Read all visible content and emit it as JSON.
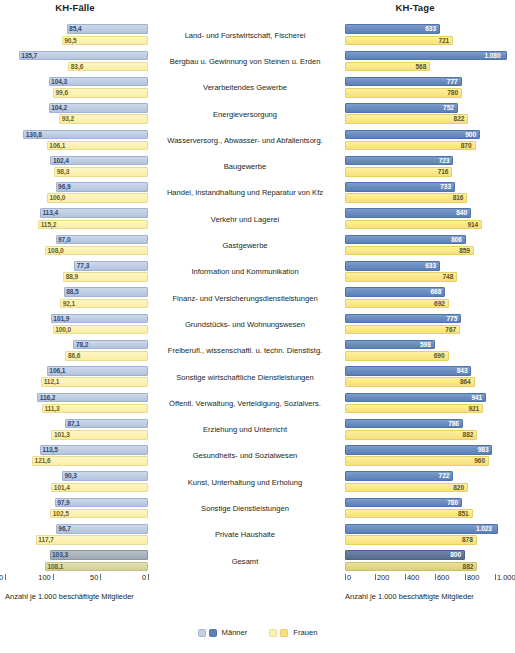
{
  "headers": {
    "left_title": "KH-Fälle",
    "right_title": "KH-Tage"
  },
  "axis": {
    "left_ticks": [
      "150",
      "100",
      "50",
      "0"
    ],
    "right_ticks": [
      "0",
      "200",
      "400",
      "600",
      "800",
      "1.000"
    ],
    "left_caption": "Anzahl je 1.000 beschäftigte Mitglieder",
    "right_caption": "Anzahl je 1.000 beschäftigte Mitglieder"
  },
  "legend": [
    {
      "label": "Männer",
      "color_light": "#c2cfe5",
      "color_dark": "#5b80b8"
    },
    {
      "label": "Frauen",
      "color_light": "#fcf2b2",
      "color_dark": "#f7e07a"
    }
  ],
  "chart_data": {
    "type": "bar",
    "title": "",
    "orientation": "horizontal",
    "layout": "butterfly/back-to-back dual panel",
    "panels": [
      {
        "name": "KH-Fälle",
        "xlabel": "Anzahl je 1.000 beschäftigte Mitglieder",
        "xlim": [
          0,
          150
        ],
        "direction": "right-to-left",
        "ticks": [
          150,
          100,
          50,
          0
        ],
        "grid": false
      },
      {
        "name": "KH-Tage",
        "xlabel": "Anzahl je 1.000 beschäftigte Mitglieder",
        "xlim": [
          0,
          1100
        ],
        "direction": "left-to-right",
        "ticks": [
          0,
          200,
          400,
          600,
          800,
          1000
        ],
        "grid": false
      }
    ],
    "legend_position": "bottom-center",
    "categories": [
      "Land- und Forstwirtschaft, Fischerei",
      "Bergbau u. Gewinnung von Steinen u. Erden",
      "Verarbeitendes Gewerbe",
      "Energieversorgung",
      "Wasserversorg., Abwasser- und Abfallentsorg.",
      "Baugewerbe",
      "Handel, Instandhaltung und Reparatur von Kfz",
      "Verkehr und Lagerei",
      "Gastgewerbe",
      "Information und Kommunikation",
      "Finanz- und Versicherungsdienstleistungen",
      "Grundstücks- und Wohnungswesen",
      "Freiberufl., wissenschaftl. u. techn. Dienstlstg.",
      "Sonstige wirtschaftliche Dienstleistungen",
      "Öffentl. Verwaltung, Verteidigung, Sozialvers.",
      "Erziehung und Unterricht",
      "Gesundheits- und Sozialwesen",
      "Kunst, Unterhaltung und Erholung",
      "Sonstige Dienstleistungen",
      "Private Haushalte",
      "Gesamt"
    ],
    "series": [
      {
        "name": "Männer",
        "panel": "KH-Fälle",
        "values": [
          85.4,
          135.7,
          104.3,
          104.2,
          130.8,
          102.4,
          96.9,
          113.4,
          97.0,
          77.3,
          88.5,
          101.9,
          78.2,
          106.1,
          116.2,
          87.1,
          113.5,
          90.3,
          97.9,
          96.7,
          103.3
        ],
        "labels": [
          "85,4",
          "135,7",
          "104,3",
          "104,2",
          "130,8",
          "102,4",
          "96,9",
          "113,4",
          "97,0",
          "77,3",
          "88,5",
          "101,9",
          "78,2",
          "106,1",
          "116,2",
          "87,1",
          "113,5",
          "90,3",
          "97,9",
          "96,7",
          "103,3"
        ]
      },
      {
        "name": "Frauen",
        "panel": "KH-Fälle",
        "values": [
          90.5,
          83.6,
          99.6,
          93.2,
          106.1,
          98.3,
          106.0,
          115.2,
          108.0,
          88.9,
          92.1,
          100.0,
          86.6,
          112.1,
          111.3,
          101.3,
          121.6,
          101.4,
          102.5,
          117.7,
          108.1
        ],
        "labels": [
          "90,5",
          "83,6",
          "99,6",
          "93,2",
          "106,1",
          "98,3",
          "106,0",
          "115,2",
          "108,0",
          "88,9",
          "92,1",
          "100,0",
          "86,6",
          "112,1",
          "111,3",
          "101,3",
          "121,6",
          "101,4",
          "102,5",
          "117,7",
          "108,1"
        ]
      },
      {
        "name": "Männer",
        "panel": "KH-Tage",
        "values": [
          633,
          1080,
          777,
          752,
          900,
          723,
          733,
          840,
          806,
          633,
          668,
          775,
          598,
          843,
          941,
          786,
          983,
          722,
          780,
          1023,
          800
        ],
        "labels": [
          "633",
          "1.080",
          "777",
          "752",
          "900",
          "723",
          "733",
          "840",
          "806",
          "633",
          "668",
          "775",
          "598",
          "843",
          "941",
          "786",
          "983",
          "722",
          "780",
          "1.023",
          "800"
        ]
      },
      {
        "name": "Frauen",
        "panel": "KH-Tage",
        "values": [
          721,
          568,
          780,
          822,
          870,
          716,
          816,
          914,
          859,
          748,
          692,
          767,
          690,
          864,
          921,
          882,
          960,
          820,
          851,
          878,
          882
        ],
        "labels": [
          "721",
          "568",
          "780",
          "822",
          "870",
          "716",
          "816",
          "914",
          "859",
          "748",
          "692",
          "767",
          "690",
          "864",
          "921",
          "882",
          "960",
          "820",
          "851",
          "878",
          "882"
        ]
      }
    ]
  }
}
